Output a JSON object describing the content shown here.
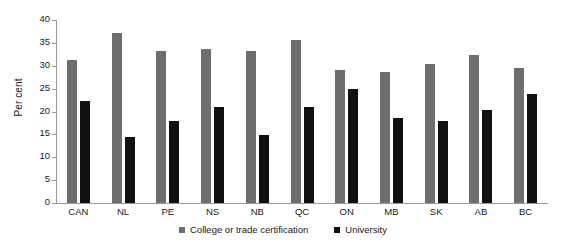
{
  "chart_data": {
    "type": "bar",
    "title": "",
    "xlabel": "",
    "ylabel": "Per cent",
    "ylim": [
      0,
      40
    ],
    "yticks": [
      0,
      5,
      10,
      15,
      20,
      25,
      30,
      35,
      40
    ],
    "grid": false,
    "legend_position": "bottom",
    "categories": [
      "CAN",
      "NL",
      "PE",
      "NS",
      "NB",
      "QC",
      "ON",
      "MB",
      "SK",
      "AB",
      "BC"
    ],
    "series": [
      {
        "name": "College or trade certification",
        "color": "#6e6e6e",
        "values": [
          31.3,
          37.2,
          33.2,
          33.7,
          33.2,
          35.6,
          29.1,
          28.6,
          30.4,
          32.3,
          29.5
        ]
      },
      {
        "name": "University",
        "color": "#111111",
        "values": [
          22.3,
          14.4,
          17.9,
          21.0,
          14.9,
          21.0,
          24.9,
          18.6,
          17.9,
          20.3,
          23.8
        ]
      }
    ]
  },
  "axis": {
    "line_color": "#9a9a9a",
    "tick_color": "#9a9a9a"
  }
}
